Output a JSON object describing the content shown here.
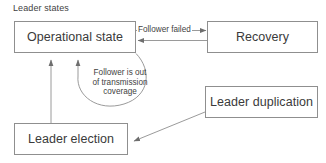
{
  "diagram": {
    "title": "Leader states",
    "type": "state-transition-diagram",
    "background_color": "#ffffff",
    "stroke_color": "#8f8f8f",
    "text_color": "#3a3a3a",
    "nodes": [
      {
        "id": "operational-state",
        "label": "Operational state"
      },
      {
        "id": "recovery",
        "label": "Recovery"
      },
      {
        "id": "leader-duplication",
        "label": "Leader duplication"
      },
      {
        "id": "leader-election",
        "label": "Leader election"
      }
    ],
    "edges": [
      {
        "id": "operational-to-recovery",
        "from": "operational-state",
        "to": "recovery",
        "label": "Follower failed"
      },
      {
        "id": "recovery-to-operational",
        "from": "recovery",
        "to": "operational-state",
        "label": ""
      },
      {
        "id": "operational-self-loop",
        "from": "operational-state",
        "to": "operational-state",
        "label_lines": [
          "Follower is out",
          "of transmission",
          "coverage"
        ]
      },
      {
        "id": "leader-election-to-operational",
        "from": "leader-election",
        "to": "operational-state",
        "label": ""
      },
      {
        "id": "leader-duplication-to-leader-election",
        "from": "leader-duplication",
        "to": "leader-election",
        "label": ""
      }
    ]
  }
}
